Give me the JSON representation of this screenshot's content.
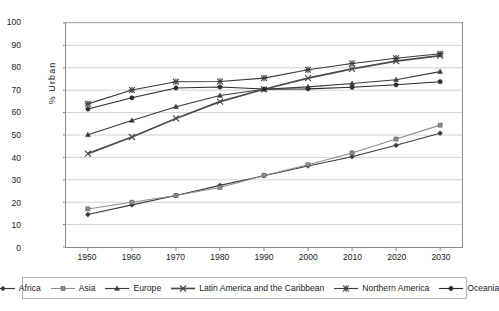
{
  "chart_data": {
    "type": "line",
    "title": "",
    "subtitle": "",
    "xlabel": "",
    "ylabel": "% Urban",
    "x": [
      1950,
      1960,
      1970,
      1980,
      1990,
      2000,
      2010,
      2020,
      2030
    ],
    "categories": [
      "1950",
      "1960",
      "1970",
      "1980",
      "1990",
      "2000",
      "2010",
      "2020",
      "2030"
    ],
    "xlim": [
      1950,
      2030
    ],
    "ylim": [
      0,
      100
    ],
    "ytick_values": [
      0,
      10,
      20,
      30,
      40,
      50,
      60,
      70,
      80,
      90,
      100
    ],
    "ytick_labels": [
      "0",
      "10",
      "20",
      "30",
      "40",
      "50",
      "60",
      "70",
      "80",
      "90",
      "100"
    ],
    "grid": "horizontal",
    "legend_position": "bottom",
    "series": [
      {
        "name": "Africa",
        "marker": "diamond",
        "color": "#3a3a3a",
        "values": [
          14.5,
          18.8,
          23.0,
          27.5,
          31.8,
          36.2,
          40.3,
          45.4,
          50.8
        ]
      },
      {
        "name": "Asia",
        "marker": "square",
        "color": "#8d8d8d",
        "values": [
          17.0,
          20.0,
          23.0,
          26.6,
          31.9,
          36.7,
          42.0,
          48.2,
          54.4
        ]
      },
      {
        "name": "Europe",
        "marker": "triangle",
        "color": "#3a3a3a",
        "values": [
          50.1,
          56.5,
          62.6,
          67.6,
          70.4,
          71.5,
          73.0,
          74.7,
          78.3
        ]
      },
      {
        "name": "Latin America and the Caribbean",
        "marker": "x",
        "color": "#4a4a4a",
        "values": [
          41.7,
          49.1,
          57.4,
          64.9,
          70.4,
          75.4,
          79.5,
          83.0,
          85.4
        ]
      },
      {
        "name": "Northern America",
        "marker": "star",
        "color": "#3a3a3a",
        "values": [
          63.9,
          70.1,
          73.8,
          73.9,
          75.4,
          79.1,
          81.9,
          84.3,
          86.3
        ]
      },
      {
        "name": "Oceania",
        "marker": "circle",
        "color": "#2b2b2b",
        "values": [
          61.6,
          66.6,
          71.0,
          71.4,
          70.5,
          70.6,
          71.3,
          72.4,
          73.8
        ]
      }
    ]
  },
  "axes": {
    "y_title": "% Urban"
  },
  "legend": {
    "entries": [
      {
        "label": "Africa"
      },
      {
        "label": "Asia"
      },
      {
        "label": "Europe"
      },
      {
        "label": "Latin America and the Caribbean"
      },
      {
        "label": "Northern America"
      },
      {
        "label": "Oceania"
      }
    ]
  }
}
